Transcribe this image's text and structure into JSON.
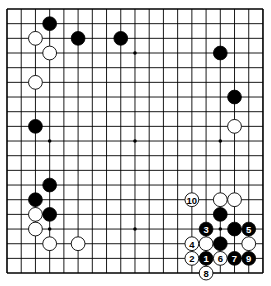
{
  "board": {
    "size": 19,
    "origin_x": 7,
    "origin_y": 9,
    "spacing_x": 14.22,
    "spacing_y": 14.67,
    "stone_radius": 6.9,
    "star_points": [
      [
        3,
        3
      ],
      [
        9,
        3
      ],
      [
        15,
        3
      ],
      [
        3,
        9
      ],
      [
        9,
        9
      ],
      [
        15,
        9
      ],
      [
        3,
        15
      ],
      [
        9,
        15
      ],
      [
        15,
        15
      ]
    ],
    "colors": {
      "black": "#000000",
      "white": "#ffffff",
      "line": "#000000",
      "background": "#ffffff"
    }
  },
  "stones": [
    {
      "color": "black",
      "col": 3,
      "row": 1
    },
    {
      "color": "white",
      "col": 2,
      "row": 2
    },
    {
      "color": "black",
      "col": 5,
      "row": 2
    },
    {
      "color": "black",
      "col": 8,
      "row": 2
    },
    {
      "color": "white",
      "col": 3,
      "row": 3
    },
    {
      "color": "white",
      "col": 2,
      "row": 5
    },
    {
      "color": "black",
      "col": 2,
      "row": 8
    },
    {
      "color": "black",
      "col": 15,
      "row": 3
    },
    {
      "color": "black",
      "col": 16,
      "row": 6
    },
    {
      "color": "white",
      "col": 16,
      "row": 8
    },
    {
      "color": "black",
      "col": 3,
      "row": 12
    },
    {
      "color": "black",
      "col": 2,
      "row": 13
    },
    {
      "color": "white",
      "col": 2,
      "row": 14
    },
    {
      "color": "black",
      "col": 3,
      "row": 14
    },
    {
      "color": "white",
      "col": 2,
      "row": 15
    },
    {
      "color": "white",
      "col": 3,
      "row": 16
    },
    {
      "color": "white",
      "col": 5,
      "row": 16
    },
    {
      "color": "white",
      "col": 15,
      "row": 13
    },
    {
      "color": "white",
      "col": 16,
      "row": 13
    },
    {
      "color": "black",
      "col": 15,
      "row": 14
    },
    {
      "color": "black",
      "col": 16,
      "row": 15
    },
    {
      "color": "white",
      "col": 14,
      "row": 16
    },
    {
      "color": "black",
      "col": 15,
      "row": 16
    },
    {
      "color": "white",
      "col": 17,
      "row": 16
    }
  ],
  "moves": [
    {
      "number": "1",
      "color": "black",
      "col": 14,
      "row": 17
    },
    {
      "number": "2",
      "color": "white",
      "col": 13,
      "row": 17
    },
    {
      "number": "3",
      "color": "black",
      "col": 14,
      "row": 15
    },
    {
      "number": "4",
      "color": "white",
      "col": 13,
      "row": 16
    },
    {
      "number": "5",
      "color": "black",
      "col": 17,
      "row": 15
    },
    {
      "number": "6",
      "color": "white",
      "col": 15,
      "row": 17
    },
    {
      "number": "7",
      "color": "black",
      "col": 16,
      "row": 17
    },
    {
      "number": "8",
      "color": "white",
      "col": 14,
      "row": 18
    },
    {
      "number": "9",
      "color": "black",
      "col": 17,
      "row": 17
    },
    {
      "number": "10",
      "color": "white",
      "col": 13,
      "row": 13
    }
  ]
}
